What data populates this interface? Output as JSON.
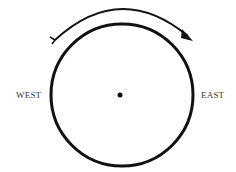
{
  "diagram": {
    "labels": {
      "west": "WEST",
      "east": "EAST"
    },
    "colors": {
      "stroke": "#111111",
      "text": "#333333",
      "background": "#ffffff"
    }
  }
}
